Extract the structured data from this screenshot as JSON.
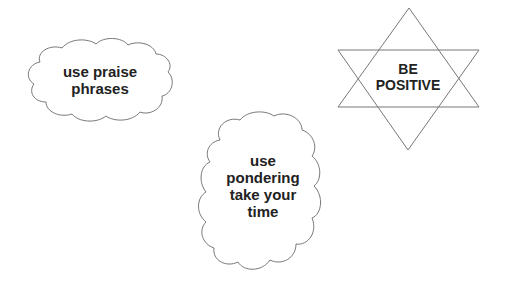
{
  "colors": {
    "background": "#ffffff",
    "outline": "#777777",
    "text": "#222222"
  },
  "shapes": [
    {
      "type": "cloud",
      "name": "praise-cloud",
      "lines": [
        "use praise",
        "phrases"
      ]
    },
    {
      "type": "six-pointed-star",
      "name": "positive-star",
      "lines": [
        "BE",
        "POSITIVE"
      ]
    },
    {
      "type": "cloud",
      "name": "pondering-cloud",
      "lines": [
        "use",
        "pondering",
        "take your",
        "time"
      ]
    }
  ]
}
